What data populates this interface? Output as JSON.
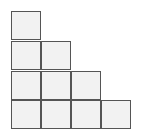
{
  "diagram": {
    "type": "staircase-grid",
    "cell_size": 30,
    "origin": [
      11,
      11
    ],
    "fill": "#f2f2f2",
    "stroke": "#555555",
    "columns_heights": [
      4,
      3,
      2,
      1
    ],
    "cells": [
      {
        "col": 0,
        "row": 0
      },
      {
        "col": 0,
        "row": 1
      },
      {
        "col": 1,
        "row": 1
      },
      {
        "col": 0,
        "row": 2
      },
      {
        "col": 1,
        "row": 2
      },
      {
        "col": 2,
        "row": 2
      },
      {
        "col": 0,
        "row": 3
      },
      {
        "col": 1,
        "row": 3
      },
      {
        "col": 2,
        "row": 3
      },
      {
        "col": 3,
        "row": 3
      }
    ]
  }
}
